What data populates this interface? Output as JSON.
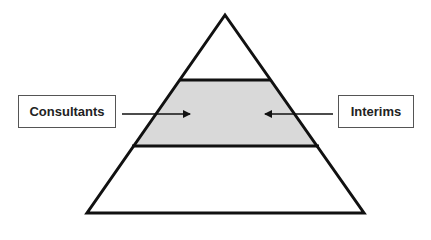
{
  "diagram": {
    "type": "pyramid",
    "levels": 3,
    "highlighted_level": "middle",
    "colors": {
      "stroke": "#111111",
      "highlight_fill": "#d9d9d9",
      "background": "#ffffff"
    },
    "labels": {
      "left": "Consultants",
      "right": "Interims"
    },
    "arrows": [
      {
        "from": "Consultants",
        "to": "middle level",
        "direction": "right"
      },
      {
        "from": "Interims",
        "to": "middle level",
        "direction": "left"
      }
    ]
  }
}
